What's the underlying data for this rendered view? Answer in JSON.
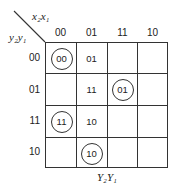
{
  "map": {
    "column_variables": "x₂x₁",
    "row_variables": "y₂y₁",
    "output_label": "Y₂Y₁",
    "column_headers": [
      "00",
      "01",
      "11",
      "10"
    ],
    "row_headers": [
      "00",
      "01",
      "11",
      "10"
    ],
    "cells": [
      [
        {
          "value": "00",
          "circled": true
        },
        {
          "value": "01",
          "circled": false
        },
        {
          "value": "",
          "circled": false
        },
        {
          "value": "",
          "circled": false
        }
      ],
      [
        {
          "value": "",
          "circled": false
        },
        {
          "value": "11",
          "circled": false
        },
        {
          "value": "01",
          "circled": true
        },
        {
          "value": "",
          "circled": false
        }
      ],
      [
        {
          "value": "11",
          "circled": true
        },
        {
          "value": "10",
          "circled": false
        },
        {
          "value": "",
          "circled": false
        },
        {
          "value": "",
          "circled": false
        }
      ],
      [
        {
          "value": "",
          "circled": false
        },
        {
          "value": "10",
          "circled": true
        },
        {
          "value": "",
          "circled": false
        },
        {
          "value": "",
          "circled": false
        }
      ]
    ]
  }
}
